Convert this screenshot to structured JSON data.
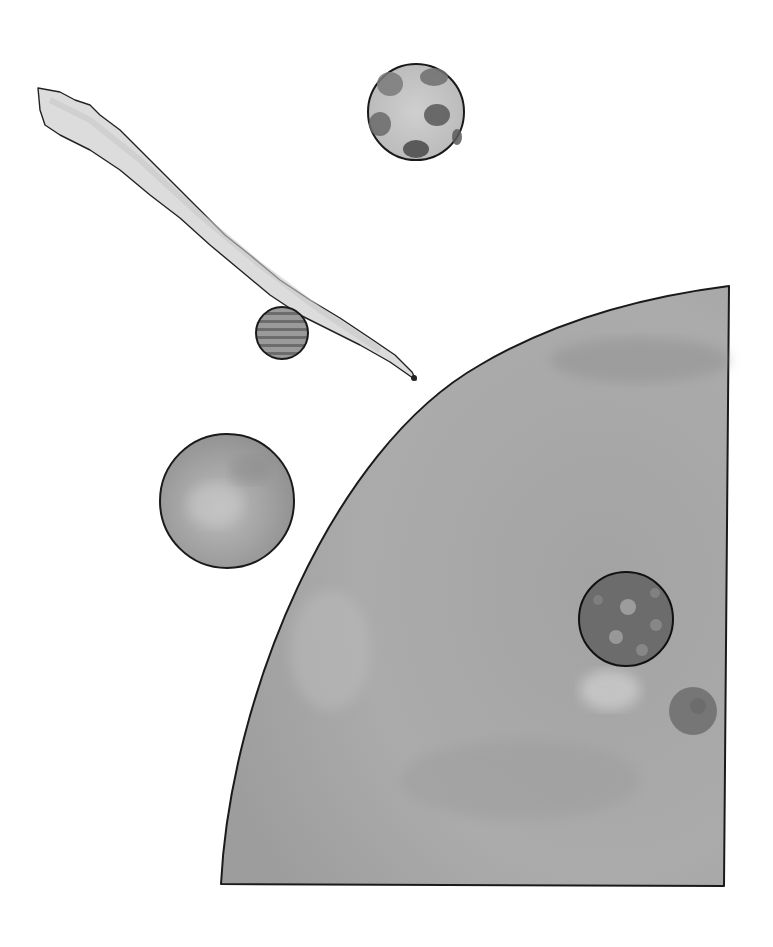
{
  "image": {
    "description": "Grayscale watercolor illustration of planets and a comet in space, with a large quarter-circle planet surface in the lower right",
    "palette": {
      "background": "#ffffff",
      "outline": "#1a1a1a",
      "large_body": "#a9a9a9",
      "large_body_shadow": "#959595",
      "dotted_planet": "#c4c4c4",
      "dotted_planet_spots": "#6e6e6e",
      "striped_planet": "#8a8a8a",
      "mottled_planet": "#9f9f9f",
      "crater_planet": "#6b6b6b",
      "small_dark_planet": "#747474",
      "comet": "#d8d8d8"
    },
    "elements": [
      {
        "name": "comet",
        "shape": "tapered tail"
      },
      {
        "name": "dotted-planet",
        "shape": "circle with spots"
      },
      {
        "name": "striped-planet",
        "shape": "small banded circle"
      },
      {
        "name": "mottled-planet",
        "shape": "circle"
      },
      {
        "name": "large-planet-quadrant",
        "shape": "quarter circle"
      },
      {
        "name": "crater-planet",
        "shape": "circle with light spots"
      },
      {
        "name": "small-dark-planet",
        "shape": "small circle"
      }
    ]
  }
}
